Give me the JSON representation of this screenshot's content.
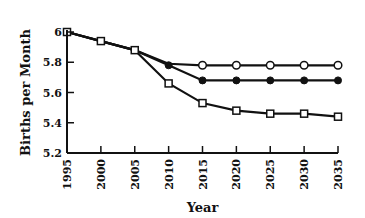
{
  "chart_data": {
    "type": "line",
    "title": "",
    "xlabel": "Year",
    "ylabel": "Births per Month",
    "x": [
      1995,
      2000,
      2005,
      2010,
      2015,
      2020,
      2025,
      2030,
      2035
    ],
    "xticks": [
      "1995",
      "2000",
      "2005",
      "2010",
      "2015",
      "2020",
      "2025",
      "2030",
      "2035"
    ],
    "yticks": [
      "5.2",
      "5.4",
      "5.6",
      "5.8",
      "6"
    ],
    "ylim": [
      5.2,
      6.0
    ],
    "xlim": [
      1995,
      2035
    ],
    "grid": false,
    "legend": null,
    "series": [
      {
        "name": "Open circles",
        "marker": "open-circle",
        "x": [
          1995,
          2000,
          2005,
          2010,
          2015,
          2020,
          2025,
          2030,
          2035
        ],
        "values": [
          6.0,
          5.94,
          5.88,
          5.79,
          5.78,
          5.78,
          5.78,
          5.78,
          5.78
        ]
      },
      {
        "name": "Filled circles",
        "marker": "filled-circle",
        "x": [
          1995,
          2000,
          2005,
          2010,
          2015,
          2020,
          2025,
          2030,
          2035
        ],
        "values": [
          6.0,
          5.94,
          5.88,
          5.78,
          5.68,
          5.68,
          5.68,
          5.68,
          5.68
        ]
      },
      {
        "name": "Open squares",
        "marker": "open-square",
        "x": [
          1995,
          2000,
          2005,
          2010,
          2015,
          2020,
          2025,
          2030,
          2035
        ],
        "values": [
          6.0,
          5.94,
          5.88,
          5.66,
          5.53,
          5.48,
          5.46,
          5.46,
          5.44
        ]
      }
    ]
  },
  "colors": {
    "ink": "#111111",
    "background": "#ffffff"
  }
}
